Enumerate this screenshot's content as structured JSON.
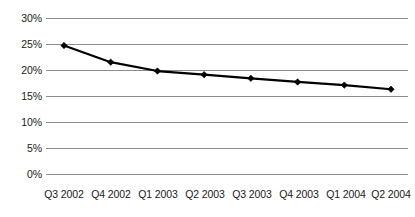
{
  "chart_data": {
    "type": "line",
    "title": "",
    "subtitle": "",
    "xlabel": "",
    "ylabel": "",
    "categories": [
      "Q3 2002",
      "Q4 2002",
      "Q1 2003",
      "Q2 2003",
      "Q3 2003",
      "Q4 2003",
      "Q1 2004",
      "Q2 2004"
    ],
    "values": [
      24.7,
      21.5,
      19.8,
      19.1,
      18.4,
      17.7,
      17.1,
      16.3
    ],
    "series": [
      {
        "name": "",
        "values": [
          24.7,
          21.5,
          19.8,
          19.1,
          18.4,
          17.7,
          17.1,
          16.3
        ],
        "color": "#000000",
        "marker": "diamond",
        "line_width": 2.2
      }
    ],
    "ylim": [
      0,
      30
    ],
    "ytick_values": [
      0,
      5,
      10,
      15,
      20,
      25,
      30
    ],
    "ytick_labels": [
      "0%",
      "5%",
      "10%",
      "15%",
      "20%",
      "25%",
      "30%"
    ],
    "grid": {
      "horizontal": true,
      "vertical": false,
      "color": "#8c8c8c"
    },
    "legend": {
      "visible": false,
      "position": "none",
      "entries": []
    },
    "annotations": [],
    "background_color": "#ffffff",
    "axis_label_color": "#1a1a1a"
  }
}
